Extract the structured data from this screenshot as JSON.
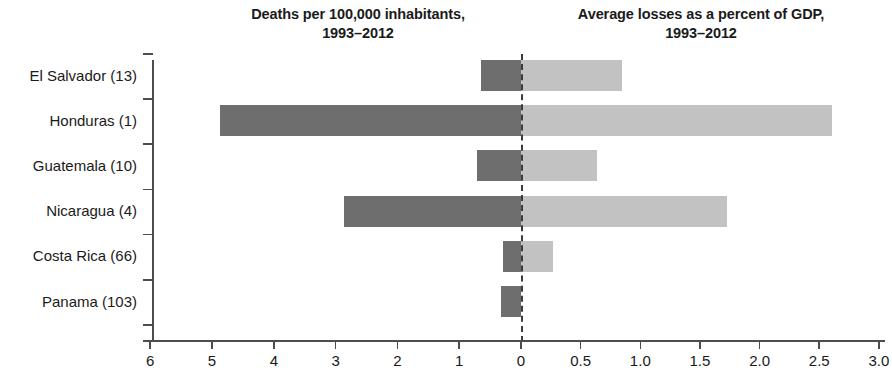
{
  "titles": {
    "left_line1": "Deaths per 100,000 inhabitants,",
    "left_line2": "1993–2012",
    "right_line1": "Average losses as a percent of GDP,",
    "right_line2": "1993–2012"
  },
  "colors": {
    "left_series": "#6e6e6e",
    "right_series": "#c2c2c2",
    "axis": "#4d4d4d",
    "zero_line": "#3b3b3b",
    "text": "#1a1a1a",
    "background": "#ffffff"
  },
  "axis": {
    "left_ticks": [
      "6",
      "5",
      "4",
      "3",
      "2",
      "1",
      "0"
    ],
    "right_ticks": [
      "0.5",
      "1.0",
      "1.5",
      "2.0",
      "2.5",
      "3.0"
    ],
    "left_max": 6,
    "right_max": 3.0,
    "zero_label": "0"
  },
  "categories": [
    "El Salvador (13)",
    "Honduras (1)",
    "Guatemala (10)",
    "Nicaragua (4)",
    "Costa Rica (66)",
    "Panama (103)"
  ],
  "chart_data": {
    "type": "bar",
    "orientation": "horizontal",
    "layout": "diverging-dual-axis",
    "xlabel": "",
    "ylabel": "",
    "categories": [
      "El Salvador (13)",
      "Honduras (1)",
      "Guatemala (10)",
      "Nicaragua (4)",
      "Costa Rica (66)",
      "Panama (103)"
    ],
    "series": [
      {
        "name": "Deaths per 100,000 inhabitants, 1993–2012",
        "side": "left",
        "axis_range": [
          0,
          6
        ],
        "axis_ticks": [
          6,
          5,
          4,
          3,
          2,
          1,
          0
        ],
        "color": "#6e6e6e",
        "values": [
          0.65,
          4.87,
          0.72,
          2.86,
          0.29,
          0.33
        ]
      },
      {
        "name": "Average losses as a percent of GDP, 1993–2012",
        "side": "right",
        "axis_range": [
          0,
          3.0
        ],
        "axis_ticks": [
          0,
          0.5,
          1.0,
          1.5,
          2.0,
          2.5,
          3.0
        ],
        "color": "#c2c2c2",
        "values": [
          0.85,
          2.61,
          0.64,
          1.73,
          0.27,
          0.0
        ]
      }
    ],
    "grid": false,
    "legend": false,
    "zero_reference": {
      "value": 0,
      "style": "dashed"
    }
  }
}
